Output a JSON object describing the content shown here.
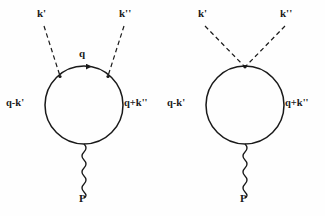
{
  "figure": {
    "type": "feynman-diagram-pair",
    "background_color": "#fefefe",
    "ink_color": "#1a1a1a"
  },
  "diagram_left": {
    "name": "direct-vertex-diagram",
    "loop": {
      "center_x": 84,
      "center_y": 105,
      "radius": 39
    },
    "labels": {
      "k_prime": "k'",
      "k_double_prime": "k''",
      "internal_q": "q",
      "left_propagator": "q-k'",
      "right_propagator": "q+k''",
      "boson": "P"
    },
    "vertices": {
      "left_dashed_attach_x": 60,
      "left_dashed_attach_y": 76,
      "right_dashed_attach_x": 108,
      "right_dashed_attach_y": 76
    },
    "arrows": [
      {
        "name": "q-arrow",
        "on": "top-arc",
        "direction": "rightward"
      },
      {
        "name": "q-minus-k-prime-arrow",
        "on": "left-side",
        "direction": "upward"
      },
      {
        "name": "q-plus-k-double-prime-arrow",
        "on": "right-side",
        "direction": "upward"
      }
    ]
  },
  "diagram_right": {
    "name": "contact-vertex-diagram",
    "loop": {
      "center_x": 245,
      "center_y": 105,
      "radius": 39
    },
    "labels": {
      "k_prime": "k'",
      "k_double_prime": "k''",
      "left_propagator": "q-k'",
      "right_propagator": "q+k''",
      "boson": "P"
    },
    "vertices": {
      "dashed_attach_x": 245,
      "dashed_attach_y": 67
    },
    "arrows": [
      {
        "name": "q-minus-k-prime-arrow",
        "on": "left-side",
        "direction": "upward"
      },
      {
        "name": "q-plus-k-double-prime-arrow",
        "on": "right-side",
        "direction": "upward"
      }
    ]
  }
}
